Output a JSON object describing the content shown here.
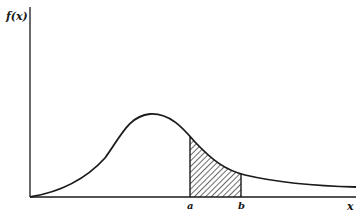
{
  "diagram": {
    "type": "probability-density-area",
    "y_axis_label": "f(x)",
    "x_axis_label": "x",
    "lower_bound_label": "a",
    "upper_bound_label": "b",
    "shaded_region": "area under f(x) between a and b (hatched)",
    "colors": {
      "stroke": "#1a1a1a",
      "background": "#ffffff"
    }
  }
}
